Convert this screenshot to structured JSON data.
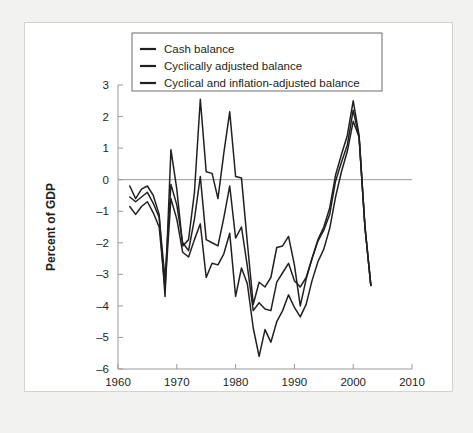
{
  "chart_data": {
    "type": "line",
    "title": "",
    "xlabel": "Year",
    "ylabel": "Percent of GDP",
    "xlim": [
      1960,
      2010
    ],
    "ylim": [
      -6,
      3
    ],
    "xticks": [
      1960,
      1970,
      1980,
      1990,
      2000,
      2010
    ],
    "xtick_labels": [
      "1960",
      "1970",
      "1980",
      "1990",
      "2000",
      "2010"
    ],
    "yticks": [
      3,
      2,
      1,
      0,
      -1,
      -2,
      -3,
      -4,
      -5,
      -6
    ],
    "ytick_labels": [
      "3",
      "2",
      "1",
      "0",
      "-1",
      "-2",
      "-3",
      "-4",
      "-5",
      "-6"
    ],
    "grid": false,
    "zero_reference_line": 0,
    "legend_position": "top-center",
    "line_color": "#231f20",
    "axis_color": "#9a9a98",
    "series": [
      {
        "name": "Cash balance",
        "x": [
          1962,
          1963,
          1964,
          1965,
          1966,
          1967,
          1968,
          1969,
          1970,
          1971,
          1972,
          1973,
          1974,
          1975,
          1976,
          1977,
          1978,
          1979,
          1980,
          1981,
          1982,
          1983,
          1984,
          1985,
          1986,
          1987,
          1988,
          1989,
          1990,
          1991,
          1992,
          1993,
          1994,
          1995,
          1996,
          1997,
          1998,
          1999,
          2000,
          2001,
          2002,
          2003
        ],
        "values": [
          -0.2,
          -0.6,
          -0.3,
          -0.2,
          -0.5,
          -1.1,
          -3.7,
          0.95,
          -0.3,
          -2.1,
          -1.9,
          -0.4,
          2.55,
          0.25,
          0.2,
          -0.6,
          0.85,
          2.15,
          0.1,
          0.05,
          -2.0,
          -3.95,
          -3.25,
          -3.4,
          -3.1,
          -2.15,
          -2.1,
          -1.8,
          -2.7,
          -4.0,
          -3.15,
          -2.5,
          -1.9,
          -1.5,
          -0.9,
          0.15,
          0.8,
          1.4,
          2.5,
          1.4,
          -1.5,
          -3.35
        ]
      },
      {
        "name": "Cyclically adjusted balance",
        "x": [
          1962,
          1963,
          1964,
          1965,
          1966,
          1967,
          1968,
          1969,
          1970,
          1971,
          1972,
          1973,
          1974,
          1975,
          1976,
          1977,
          1978,
          1979,
          1980,
          1981,
          1982,
          1983,
          1984,
          1985,
          1986,
          1987,
          1988,
          1989,
          1990,
          1991,
          1992,
          1993,
          1994,
          1995,
          1996,
          1997,
          1998,
          1999,
          2000,
          2001,
          2002,
          2003
        ],
        "values": [
          -0.55,
          -0.7,
          -0.55,
          -0.4,
          -0.75,
          -1.2,
          -3.15,
          -0.15,
          -0.8,
          -2.0,
          -2.25,
          -1.25,
          0.1,
          -1.9,
          -2.0,
          -2.1,
          -1.2,
          -0.2,
          -1.85,
          -1.5,
          -2.75,
          -4.15,
          -3.9,
          -4.1,
          -4.15,
          -3.25,
          -2.95,
          -2.65,
          -3.2,
          -3.4,
          -3.1,
          -2.5,
          -1.95,
          -1.6,
          -1.1,
          -0.05,
          0.55,
          1.1,
          2.2,
          1.35,
          -1.5,
          -3.35
        ]
      },
      {
        "name": "Cyclical and inflation-adjusted balance",
        "x": [
          1962,
          1963,
          1964,
          1965,
          1966,
          1967,
          1968,
          1969,
          1970,
          1971,
          1972,
          1973,
          1974,
          1975,
          1976,
          1977,
          1978,
          1979,
          1980,
          1981,
          1982,
          1983,
          1984,
          1985,
          1986,
          1987,
          1988,
          1989,
          1990,
          1991,
          1992,
          1993,
          1994,
          1995,
          1996,
          1997,
          1998,
          1999,
          2000,
          2001,
          2002,
          2003
        ],
        "values": [
          -0.85,
          -1.1,
          -0.85,
          -0.7,
          -1.05,
          -1.5,
          -3.45,
          -0.6,
          -1.25,
          -2.3,
          -2.45,
          -1.9,
          -1.4,
          -3.1,
          -2.65,
          -2.7,
          -2.35,
          -1.7,
          -3.7,
          -2.8,
          -3.3,
          -4.7,
          -5.6,
          -4.75,
          -5.15,
          -4.5,
          -4.15,
          -3.65,
          -4.05,
          -4.35,
          -3.95,
          -3.2,
          -2.6,
          -2.2,
          -1.55,
          -0.55,
          0.25,
          0.9,
          1.85,
          1.35,
          -1.5,
          -3.35
        ]
      }
    ]
  },
  "legend": {
    "entries": [
      {
        "label": "Cash balance"
      },
      {
        "label": "Cyclically adjusted balance"
      },
      {
        "label": "Cyclical and inflation-adjusted balance"
      }
    ]
  }
}
